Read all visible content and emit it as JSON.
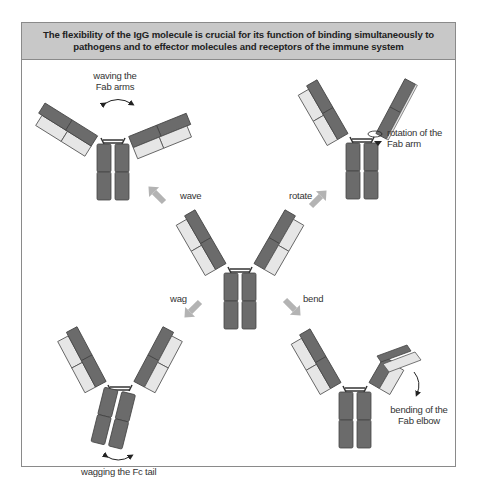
{
  "title": {
    "line1": "The flexibility of the IgG molecule is crucial for its function of binding simultaneously to",
    "line2": "pathogens and to effector molecules and receptors of the immune system"
  },
  "motions": {
    "wave": {
      "arrow_label": "wave",
      "caption_line1": "waving the",
      "caption_line2": "Fab arms"
    },
    "rotate": {
      "arrow_label": "rotate",
      "caption_line1": "rotation of the",
      "caption_line2": "Fab arm"
    },
    "wag": {
      "arrow_label": "wag",
      "caption": "wagging the Fc tail"
    },
    "bend": {
      "arrow_label": "bend",
      "caption_line1": "bending of the",
      "caption_line2": "Fab elbow"
    }
  },
  "colors": {
    "heavy_chain": "#6b6b6b",
    "light_chain": "#e6e6e6",
    "arrow": "#b3b3b3",
    "header_bg": "#c8c8c8",
    "frame": "#8a8a8a"
  }
}
